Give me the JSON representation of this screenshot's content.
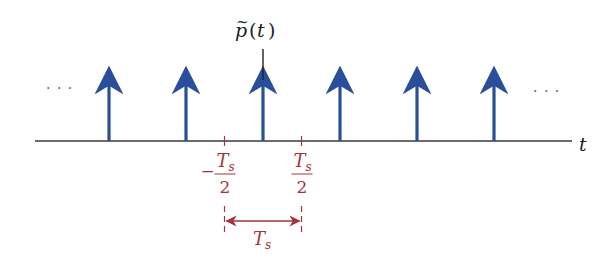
{
  "diagram": {
    "title_label": {
      "base": "p",
      "accent": "~",
      "paren_open": "(",
      "var": "t",
      "paren_close": ")"
    },
    "axis_label": "t",
    "ellipsis_left": "· · ·",
    "ellipsis_right": "· · ·",
    "impulse_count": 6,
    "impulse_indices": [
      -2,
      -1,
      0,
      1,
      2,
      3
    ],
    "center_index": 0,
    "ticks": [
      {
        "name": "neg-half-period",
        "sign": "−",
        "numerator": "T",
        "numerator_sub": "s",
        "denominator": "2",
        "position": -0.5
      },
      {
        "name": "pos-half-period",
        "sign": "",
        "numerator": "T",
        "numerator_sub": "s",
        "denominator": "2",
        "position": 0.5
      }
    ],
    "interval": {
      "label": "T",
      "label_sub": "s",
      "from": -0.5,
      "to": 0.5
    },
    "colors": {
      "impulse": "#2a4f9a",
      "axis": "#3a3a3a",
      "annotation": "#a8323a",
      "text": "#222222"
    }
  }
}
